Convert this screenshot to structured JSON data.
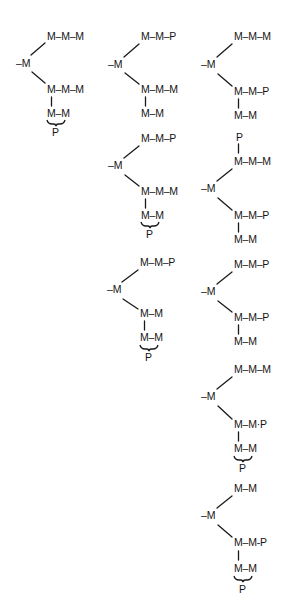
{
  "figure": {
    "columns": [
      {
        "id": "col1",
        "structures": [
          {
            "id": "c1s1",
            "top_arm": "M–M–M",
            "branch": "–M",
            "bottom_arm": "M–M–M",
            "bottom_sub_chain": "M–M",
            "bottom_sub_brace_label": "P"
          }
        ]
      },
      {
        "id": "col2",
        "structures": [
          {
            "id": "c2s1",
            "top_arm": "M–M–P",
            "branch": "–M",
            "bottom_arm": "M–M–M",
            "bottom_sub_chain": "M–M"
          },
          {
            "id": "c2s2",
            "top_arm": "M–M–P",
            "branch": "–M",
            "bottom_arm": "M–M–M",
            "bottom_sub_chain": "M–M",
            "bottom_sub_brace_label": "P"
          },
          {
            "id": "c2s3",
            "top_arm": "M–M–P",
            "branch": "–M",
            "bottom_arm": "M–M",
            "bottom_sub_chain": "M–M",
            "bottom_sub_brace_label": "P"
          }
        ]
      },
      {
        "id": "col3",
        "structures": [
          {
            "id": "c3s1",
            "top_arm": "M–M–M",
            "branch": "–M",
            "bottom_arm": "M–M–P",
            "bottom_sub_chain": "M–M"
          },
          {
            "id": "c3s2",
            "top_pendant": "P",
            "top_arm": "M–M–M",
            "branch": "–M",
            "bottom_arm": "M–M–P",
            "bottom_sub_chain": "M–M"
          },
          {
            "id": "c3s3",
            "top_arm": "M–M–P",
            "branch": "–M",
            "bottom_arm": "M–M–P",
            "bottom_sub_chain": "M–M"
          },
          {
            "id": "c3s4",
            "top_arm": "M–M–M",
            "branch": "–M",
            "bottom_arm": "M–M·P",
            "bottom_sub_chain": "M–M",
            "bottom_sub_brace_label": "P"
          },
          {
            "id": "c3s5",
            "top_arm": "M–M",
            "branch": "–M",
            "bottom_arm": "M–M-P",
            "bottom_sub_chain": "M–M",
            "bottom_sub_brace_label": "P"
          }
        ]
      }
    ]
  }
}
